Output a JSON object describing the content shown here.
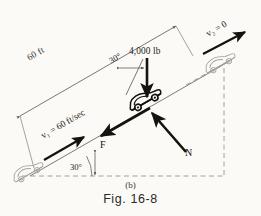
{
  "figure": {
    "caption_part": "(b)",
    "caption_label": "Fig. 16-8",
    "background_color": "#fbfaf7",
    "ink_color": "#1d1b19",
    "light_ink_color": "#9a9894"
  },
  "labels": {
    "distance": "60 ft",
    "weight": "4,000 lb",
    "weight_angle": "30°",
    "incline_angle": "30°",
    "velocity_initial": "v₁ = 60 ft/sec",
    "velocity_final": "v₂ = 0",
    "friction_force": "F",
    "normal_force": "N"
  },
  "diagram": {
    "incline_angle_degrees": 30,
    "distance_value": 60,
    "distance_unit": "ft",
    "weight_value": 4000,
    "weight_unit": "lb",
    "initial_speed_value": 60,
    "initial_speed_unit": "ft/sec",
    "final_speed_value": 0,
    "vectors": [
      {
        "name": "weight",
        "label": "4,000 lb",
        "direction": "down"
      },
      {
        "name": "friction",
        "label": "F",
        "direction": "down-slope"
      },
      {
        "name": "normal",
        "label": "N",
        "direction": "perpendicular-to-slope"
      },
      {
        "name": "initial-velocity",
        "label": "v₁ = 60 ft/sec",
        "direction": "up-slope"
      },
      {
        "name": "final-velocity",
        "label": "v₂ = 0",
        "direction": "up-slope"
      }
    ],
    "cars": [
      {
        "name": "car-start",
        "position": "lower-left",
        "style": "outline"
      },
      {
        "name": "car-middle",
        "position": "center",
        "style": "solid"
      },
      {
        "name": "car-end",
        "position": "upper-right",
        "style": "outline"
      }
    ]
  }
}
